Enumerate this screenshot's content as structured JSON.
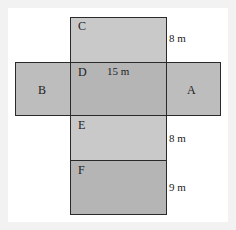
{
  "diagram": {
    "type": "net-of-rectangular-prism",
    "faces": [
      {
        "id": "C",
        "label": "C",
        "color": "#c9c9c9"
      },
      {
        "id": "B",
        "label": "B",
        "color": "#bdbdbd"
      },
      {
        "id": "D",
        "label": "D",
        "color": "#b5b5b5"
      },
      {
        "id": "A",
        "label": "A",
        "color": "#bdbdbd"
      },
      {
        "id": "E",
        "label": "E",
        "color": "#c9c9c9"
      },
      {
        "id": "F",
        "label": "F",
        "color": "#b5b5b5"
      }
    ],
    "dimensions": {
      "c_height": "8 m",
      "d_width": "15 m",
      "e_height": "8 m",
      "f_height": "9 m"
    }
  }
}
